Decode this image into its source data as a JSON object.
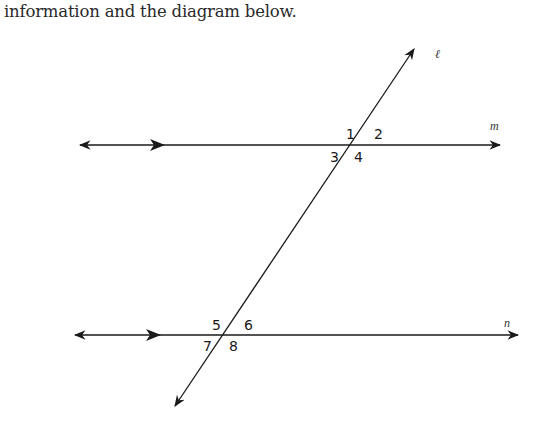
{
  "caption": "information and the diagram below.",
  "diagram": {
    "lines": {
      "transversal": {
        "label": "ℓ"
      },
      "upper_parallel": {
        "label": "m"
      },
      "lower_parallel": {
        "label": "n"
      }
    },
    "angles": {
      "a1": "1",
      "a2": "2",
      "a3": "3",
      "a4": "4",
      "a5": "5",
      "a6": "6",
      "a7": "7",
      "a8": "8"
    },
    "line_color": "#1a1a1a"
  }
}
